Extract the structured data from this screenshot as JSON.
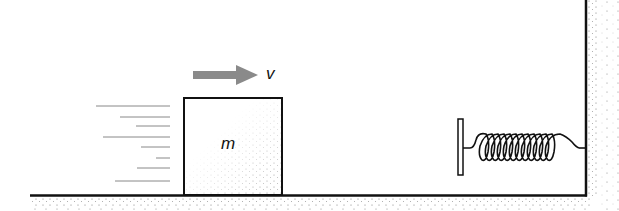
{
  "diagram": {
    "block_label": "m",
    "velocity_label": "v",
    "colors": {
      "line": "#111111",
      "arrow": "#8a8a8a",
      "stipple": "#777777"
    }
  }
}
